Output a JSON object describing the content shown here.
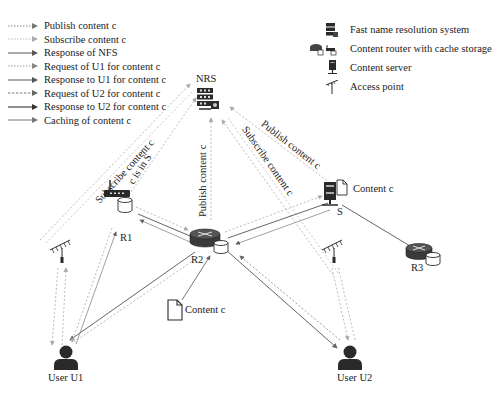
{
  "legend_left": {
    "items": [
      {
        "label": "Publish content c",
        "style": "dotted"
      },
      {
        "label": "Subscribe content c",
        "style": "dotted-light"
      },
      {
        "label": "Response of NFS",
        "style": "solid"
      },
      {
        "label": "Request of U1 for content c",
        "style": "dotted"
      },
      {
        "label": "Response to U1 for content c",
        "style": "solid"
      },
      {
        "label": "Request of U2 for content c",
        "style": "dashed"
      },
      {
        "label": "Response to U2 for content c",
        "style": "solid-dark"
      },
      {
        "label": "Caching of content c",
        "style": "solid-light"
      }
    ]
  },
  "legend_right": {
    "items": [
      {
        "label": "Fast name resolution system",
        "icon": "server-rack-icon"
      },
      {
        "label": "Content router with cache storage",
        "icon": "router-cache-icon"
      },
      {
        "label": "Content server",
        "icon": "content-server-icon"
      },
      {
        "label": "Access point",
        "icon": "antenna-icon"
      }
    ]
  },
  "nodes": {
    "nrs": "NRS",
    "r1": "R1",
    "r2": "R2",
    "r3": "R3",
    "s": "S",
    "user_u1": "User U1",
    "user_u2": "User U2",
    "content_server": "Content c",
    "content_r2": "Content c"
  },
  "edge_labels": {
    "subscribe_left": "Subscribe content c",
    "c_in_s": "c is in S",
    "publish_center": "Publish content c",
    "subscribe_center": "Subscribe content c",
    "publish_right": "Publish content c"
  },
  "colors": {
    "line": "#555555",
    "line_light": "#999999",
    "icon": "#2a2a2a"
  }
}
